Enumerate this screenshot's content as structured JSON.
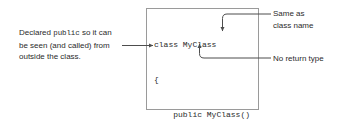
{
  "diagram": {
    "stroke_color": "#4d4d4d",
    "box_border_color": "#9a9a9a",
    "text_color": "#2b2b2b"
  },
  "code_box": {
    "language": "csharp",
    "lines": [
      "class MyClass",
      "{",
      "    public MyClass()",
      "    {",
      "        ...",
      "    }",
      "    ...",
      "}"
    ]
  },
  "annotations": {
    "left_note": {
      "line1_pre": "Declared ",
      "line1_mono": "public",
      "line1_post": " so it can",
      "line2": "be seen (and called) from",
      "line3": "outside the class."
    },
    "same_as_class_name": {
      "line1": "Same as",
      "line2": "class name"
    },
    "no_return_type": {
      "line1": "No return type"
    }
  }
}
